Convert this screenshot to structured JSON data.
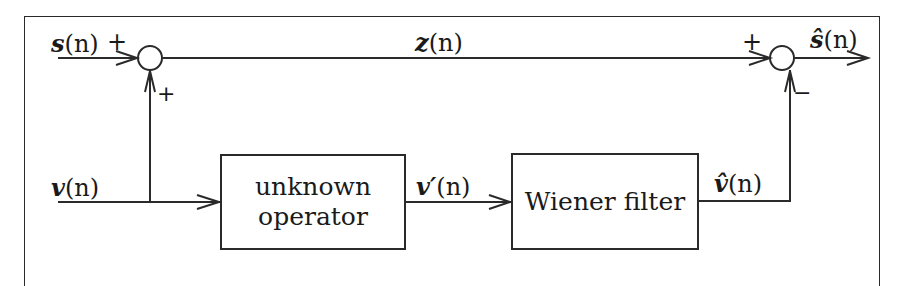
{
  "diagram": {
    "type": "block-diagram",
    "blocks": [
      {
        "id": "unknown-operator",
        "line1": "unknown",
        "line2": "operator"
      },
      {
        "id": "wiener-filter",
        "line1": "Wiener filter"
      }
    ],
    "signals": {
      "s": {
        "name": "s",
        "arg": "(n)"
      },
      "z": {
        "name": "z",
        "arg": "(n)"
      },
      "s_hat": {
        "name": "ŝ",
        "arg": "(n)"
      },
      "v": {
        "name": "v",
        "arg": "(n)"
      },
      "v_prime": {
        "name": "v′",
        "arg": "(n)"
      },
      "v_hat": {
        "name": "v̂",
        "arg": "(n)"
      }
    },
    "junctions": {
      "sum1": {
        "input_top_sign": "+",
        "input_bottom_sign": "+"
      },
      "sum2": {
        "input_top_sign": "+",
        "input_bottom_sign": "−"
      }
    },
    "connections": [
      "s(n) -> sum1 (+)",
      "v(n) -> sum1 (+)",
      "sum1 -> z(n) -> sum2 (+)",
      "v(n) -> unknown operator",
      "unknown operator -> v'(n) -> Wiener filter",
      "Wiener filter -> v̂(n) -> sum2 (−)",
      "sum2 -> ŝ(n)"
    ]
  }
}
